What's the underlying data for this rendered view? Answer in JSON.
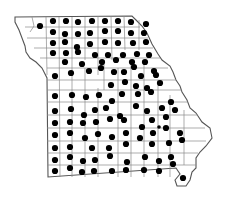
{
  "map": {
    "subject": "Missouri county distribution map",
    "colors": {
      "background": "#ffffff",
      "outline": "#555555",
      "county_lines": "#8a8a8a",
      "dot": "#000000"
    },
    "dot_radius": 3.1,
    "dots": [
      [
        40,
        26
      ],
      [
        53,
        21
      ],
      [
        66,
        21
      ],
      [
        78,
        22
      ],
      [
        92,
        21
      ],
      [
        105,
        21
      ],
      [
        118,
        21
      ],
      [
        131,
        22
      ],
      [
        146,
        24
      ],
      [
        53,
        32
      ],
      [
        65,
        34
      ],
      [
        78,
        34
      ],
      [
        90,
        33
      ],
      [
        105,
        31
      ],
      [
        118,
        31
      ],
      [
        131,
        33
      ],
      [
        144,
        33
      ],
      [
        53,
        43
      ],
      [
        65,
        42
      ],
      [
        77,
        47
      ],
      [
        90,
        44
      ],
      [
        105,
        42
      ],
      [
        118,
        43
      ],
      [
        133,
        43
      ],
      [
        146,
        42
      ],
      [
        53,
        53
      ],
      [
        66,
        53
      ],
      [
        78,
        52
      ],
      [
        95,
        55
      ],
      [
        108,
        55
      ],
      [
        123,
        55
      ],
      [
        137,
        54
      ],
      [
        149,
        55
      ],
      [
        65,
        62
      ],
      [
        82,
        64
      ],
      [
        102,
        62
      ],
      [
        116,
        60
      ],
      [
        132,
        62
      ],
      [
        145,
        62
      ],
      [
        154,
        71
      ],
      [
        55,
        76
      ],
      [
        71,
        73
      ],
      [
        89,
        71
      ],
      [
        101,
        68
      ],
      [
        114,
        72
      ],
      [
        124,
        72
      ],
      [
        134,
        67
      ],
      [
        141,
        76
      ],
      [
        156,
        75
      ],
      [
        111,
        85
      ],
      [
        125,
        82
      ],
      [
        136,
        86
      ],
      [
        147,
        88
      ],
      [
        160,
        83
      ],
      [
        55,
        96
      ],
      [
        72,
        95
      ],
      [
        86,
        97
      ],
      [
        99,
        95
      ],
      [
        112,
        101
      ],
      [
        122,
        94
      ],
      [
        138,
        94
      ],
      [
        151,
        92
      ],
      [
        171,
        102
      ],
      [
        55,
        111
      ],
      [
        71,
        109
      ],
      [
        84,
        115
      ],
      [
        95,
        110
      ],
      [
        106,
        108
      ],
      [
        120,
        116
      ],
      [
        136,
        106
      ],
      [
        147,
        111
      ],
      [
        162,
        108
      ],
      [
        175,
        110
      ],
      [
        55,
        123
      ],
      [
        70,
        122
      ],
      [
        83,
        123
      ],
      [
        96,
        122
      ],
      [
        110,
        119
      ],
      [
        124,
        120
      ],
      [
        152,
        120
      ],
      [
        166,
        117
      ],
      [
        55,
        135
      ],
      [
        70,
        133
      ],
      [
        85,
        138
      ],
      [
        98,
        134
      ],
      [
        112,
        137
      ],
      [
        126,
        133
      ],
      [
        142,
        127
      ],
      [
        153,
        133
      ],
      [
        166,
        128
      ],
      [
        180,
        133
      ],
      [
        55,
        148
      ],
      [
        70,
        147
      ],
      [
        92,
        148
      ],
      [
        109,
        148
      ],
      [
        126,
        144
      ],
      [
        140,
        138
      ],
      [
        152,
        144
      ],
      [
        169,
        143
      ],
      [
        182,
        140
      ],
      [
        55,
        160
      ],
      [
        70,
        157
      ],
      [
        83,
        161
      ],
      [
        95,
        160
      ],
      [
        110,
        156
      ],
      [
        127,
        162
      ],
      [
        145,
        157
      ],
      [
        159,
        161
      ],
      [
        171,
        157
      ],
      [
        55,
        171
      ],
      [
        70,
        168
      ],
      [
        82,
        172
      ],
      [
        94,
        171
      ],
      [
        112,
        171
      ],
      [
        126,
        170
      ],
      [
        144,
        170
      ],
      [
        159,
        171
      ],
      [
        173,
        164
      ],
      [
        183,
        178
      ]
    ],
    "small_dots": [
      [
        159,
        127
      ]
    ]
  }
}
